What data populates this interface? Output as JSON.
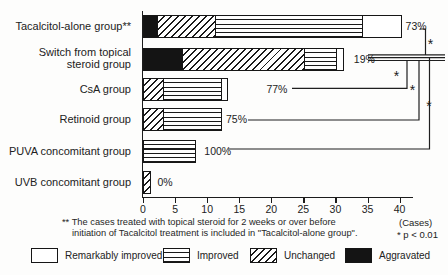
{
  "chart_data": {
    "type": "bar",
    "orientation": "horizontal",
    "title": "",
    "xlabel": "(Cases)",
    "ylabel": "",
    "x_axis": {
      "ticks": [
        0,
        5,
        10,
        15,
        20,
        25,
        30,
        35,
        40
      ],
      "unit_label": "(Cases)",
      "grid": false
    },
    "categories": [
      "Tacalcitol-alone group**",
      "Switch from topical steroid group",
      "CsA group",
      "Retinoid group",
      "PUVA concomitant group",
      "UVB concomitant group"
    ],
    "stack_order_note": "segments left-to-right: Aggravated, Unchanged, Improved, Remarkably improved",
    "series": [
      {
        "name": "Aggravated",
        "pattern": "solid-black",
        "values": [
          2,
          6,
          0,
          0,
          0,
          0
        ]
      },
      {
        "name": "Unchanged",
        "pattern": "diagonal-hatch",
        "values": [
          9,
          19,
          3,
          3,
          0,
          1
        ]
      },
      {
        "name": "Improved",
        "pattern": "horizontal-lines",
        "values": [
          23,
          5,
          9,
          9,
          8,
          0
        ]
      },
      {
        "name": "Remarkably improved",
        "pattern": "white",
        "values": [
          6,
          1,
          1,
          0,
          0,
          0
        ]
      }
    ],
    "totals": [
      40,
      31,
      13,
      12,
      8,
      1
    ],
    "percent_labels": [
      "73%",
      "19%",
      "77%",
      "75%",
      "100%",
      "0%"
    ],
    "significance_marker": "*",
    "comparisons": [
      {
        "between": [
          "Tacalcitol-alone group**",
          "Switch from topical steroid group"
        ],
        "marker": "*"
      },
      {
        "between": [
          "Switch from topical steroid group",
          "CsA group"
        ],
        "marker": "*"
      },
      {
        "between": [
          "Switch from topical steroid group",
          "Retinoid group"
        ],
        "marker": "*"
      },
      {
        "between": [
          "Switch from topical steroid group",
          "PUVA concomitant group"
        ],
        "marker": "*"
      }
    ]
  },
  "legend": [
    {
      "label": "Remarkably improved",
      "pattern": "white"
    },
    {
      "label": "Improved",
      "pattern": "horizontal-lines"
    },
    {
      "label": "Unchanged",
      "pattern": "diagonal-hatch"
    },
    {
      "label": "Aggravated",
      "pattern": "solid-black"
    }
  ],
  "footnote": {
    "line1": "** The cases treated with topical steroid for 2 weeks or over before",
    "line2": "initiation of Tacalcitol treatment is included in \"Tacalcitol-alone group\".",
    "cases_label": "(Cases)",
    "p_note": "* p < 0.01"
  },
  "colors": {
    "ink": "#1c1c1c",
    "background": "#fdfdfc"
  }
}
